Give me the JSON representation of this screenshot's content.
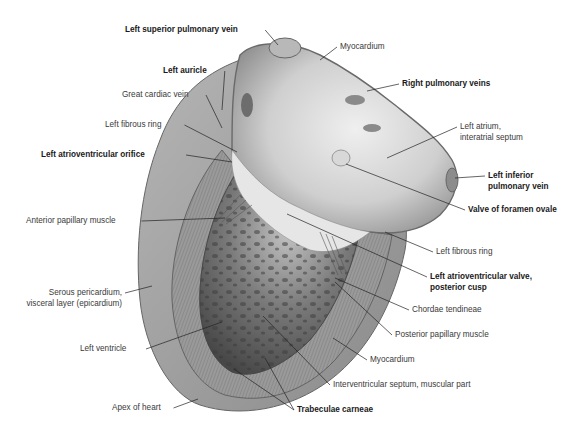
{
  "figure": {
    "labels": [
      {
        "id": "left-superior-pulmonary-vein",
        "text": "Left superior pulmonary vein",
        "bold": true,
        "x": 125,
        "y": 25,
        "align": "left",
        "pt": [
          278,
          45
        ]
      },
      {
        "id": "left-auricle",
        "text": "Left auricle",
        "bold": true,
        "x": 163,
        "y": 66,
        "align": "left",
        "pt": [
          222,
          110
        ]
      },
      {
        "id": "great-cardiac-vein",
        "text": "Great cardiac vein",
        "bold": false,
        "x": 122,
        "y": 90,
        "align": "left",
        "pt": [
          222,
          128
        ]
      },
      {
        "id": "left-fibrous-ring-1",
        "text": "Left fibrous ring",
        "bold": false,
        "x": 105,
        "y": 120,
        "align": "left",
        "pt": [
          237,
          152
        ]
      },
      {
        "id": "left-atrioventricular-orifice",
        "text": "Left atrioventricular orifice",
        "bold": true,
        "x": 41,
        "y": 150,
        "align": "left",
        "pt": [
          232,
          162
        ]
      },
      {
        "id": "myocardium-top",
        "text": "Myocardium",
        "bold": false,
        "x": 340,
        "y": 42,
        "align": "left",
        "pt": [
          320,
          60
        ]
      },
      {
        "id": "right-pulmonary-veins",
        "text": "Right pulmonary veins",
        "bold": true,
        "x": 402,
        "y": 79,
        "align": "left",
        "pt": [
          367,
          91
        ]
      },
      {
        "id": "left-atrium-interatrial-septum",
        "text": [
          "Left atrium,",
          "interatrial septum"
        ],
        "bold": false,
        "x": 460,
        "y": 122,
        "align": "left",
        "pt": [
          387,
          158
        ]
      },
      {
        "id": "left-inferior-pulmonary-vein",
        "text": [
          "Left inferior",
          "pulmonary vein"
        ],
        "bold": true,
        "x": 488,
        "y": 171,
        "align": "left",
        "pt": [
          455,
          178
        ]
      },
      {
        "id": "valve-of-foramen-ovale",
        "text": "Valve of foramen ovale",
        "bold": true,
        "x": 468,
        "y": 205,
        "align": "left",
        "pt": [
          346,
          164
        ]
      },
      {
        "id": "anterior-papillary-muscle",
        "text": "Anterior papillary muscle",
        "bold": false,
        "x": 26,
        "y": 216,
        "align": "left",
        "pt": [
          225,
          218
        ]
      },
      {
        "id": "left-fibrous-ring-2",
        "text": "Left fibrous ring",
        "bold": false,
        "x": 436,
        "y": 247,
        "align": "left",
        "pt": [
          385,
          232
        ]
      },
      {
        "id": "left-atrioventricular-valve-posterior-cusp",
        "text": [
          "Left atrioventricular valve,",
          "posterior cusp"
        ],
        "bold": true,
        "x": 430,
        "y": 272,
        "align": "left",
        "pt": [
          287,
          214
        ]
      },
      {
        "id": "chordae-tendineae",
        "text": "Chordae tendineae",
        "bold": false,
        "x": 412,
        "y": 305,
        "align": "left",
        "pt": [
          335,
          278
        ]
      },
      {
        "id": "serous-pericardium",
        "text": [
          "Serous pericardium,",
          "visceral layer (epicardium)"
        ],
        "bold": false,
        "x": 25,
        "y": 288,
        "align": "right",
        "w": 97,
        "pt": [
          152,
          286
        ]
      },
      {
        "id": "posterior-papillary-muscle",
        "text": "Posterior papillary muscle",
        "bold": false,
        "x": 395,
        "y": 330,
        "align": "left",
        "pt": [
          335,
          282
        ]
      },
      {
        "id": "left-ventricle",
        "text": "Left ventricle",
        "bold": false,
        "x": 80,
        "y": 344,
        "align": "left",
        "pt": [
          222,
          322
        ]
      },
      {
        "id": "myocardium-bottom",
        "text": "Myocardium",
        "bold": false,
        "x": 370,
        "y": 355,
        "align": "left",
        "pt": [
          333,
          338
        ]
      },
      {
        "id": "interventricular-septum",
        "text": "Interventricular septum, muscular part",
        "bold": false,
        "x": 333,
        "y": 380,
        "align": "left",
        "pt": [
          263,
          316
        ]
      },
      {
        "id": "apex-of-heart",
        "text": "Apex of heart",
        "bold": false,
        "x": 112,
        "y": 403,
        "align": "left",
        "pt": [
          198,
          399
        ]
      },
      {
        "id": "trabeculae-carneae",
        "text": "Trabeculae carneae",
        "bold": true,
        "x": 297,
        "y": 405,
        "align": "left",
        "pt": [
          [
            234,
            369
          ],
          [
            265,
            358
          ]
        ]
      }
    ]
  }
}
